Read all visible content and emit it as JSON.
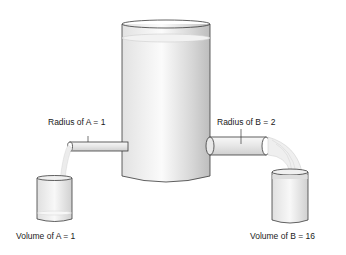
{
  "diagram": {
    "labels": {
      "radius_a": "Radius of A = 1",
      "radius_b": "Radius of B = 2",
      "volume_a": "Volume of A = 1",
      "volume_b": "Volume of B = 16"
    },
    "colors": {
      "outline": "#3a3a3a",
      "tank_fill": "#ececec",
      "water": "#f4f4f4",
      "shade": "#c8c8c8"
    }
  }
}
